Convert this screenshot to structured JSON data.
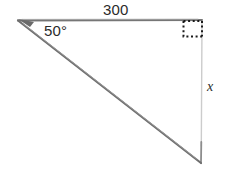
{
  "figure": {
    "kind": "geometry-diagram",
    "shape": "right-triangle",
    "background_color": "#ffffff",
    "stroke_color": "#6e6e6e",
    "faint_stroke_color": "#c9c9c9",
    "marker_color": "#1a1a1a",
    "text_color": "#2b2b2b",
    "width": 225,
    "height": 174
  },
  "labels": {
    "top_side": "300",
    "angle": "50°",
    "unknown_side": "x"
  },
  "geometry": {
    "vertices": {
      "apex_left": {
        "x": 18,
        "y": 20
      },
      "corner_top_right": {
        "x": 202,
        "y": 20
      },
      "corner_bottom_right": {
        "x": 201,
        "y": 163
      }
    },
    "sides": [
      {
        "name": "top-side",
        "from": "apex_left",
        "to": "corner_top_right",
        "label": "300",
        "style": "pencil-solid"
      },
      {
        "name": "hypotenuse",
        "from": "apex_left",
        "to": "corner_bottom_right",
        "label": "",
        "style": "pencil-solid"
      },
      {
        "name": "right-side",
        "from": "corner_top_right",
        "to": "corner_bottom_right",
        "label": "x",
        "style": "faint-solid"
      }
    ],
    "angle_marks": [
      {
        "name": "angle-50",
        "at": "apex_left",
        "label": "50°"
      },
      {
        "name": "right-angle-marker",
        "at": "corner_top_right",
        "label": "",
        "style": "dotted-square",
        "size": 19
      }
    ]
  }
}
